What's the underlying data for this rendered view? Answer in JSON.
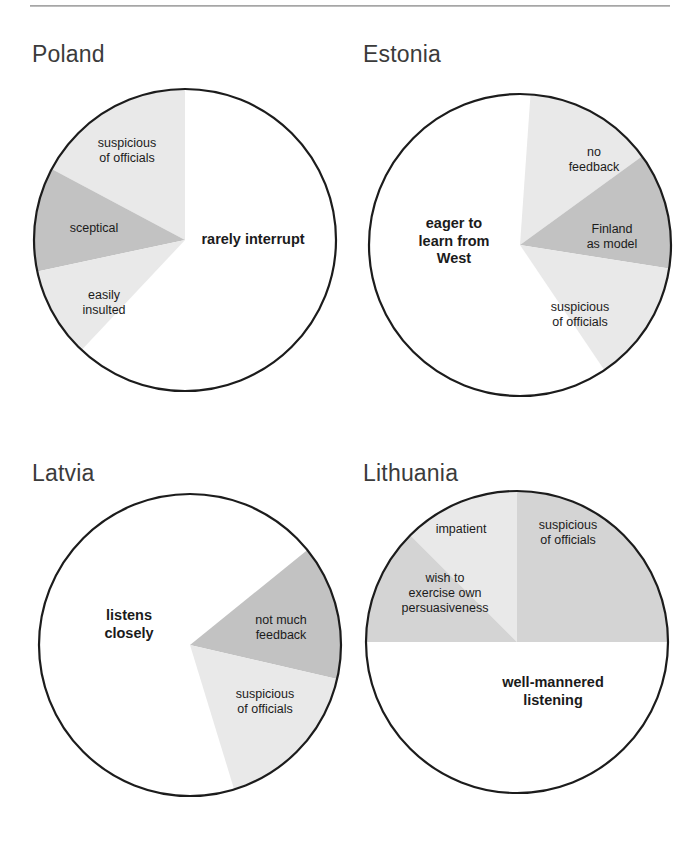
{
  "page": {
    "background_color": "#ffffff",
    "divider_color": "#9a9a9a"
  },
  "palette": {
    "white": "#ffffff",
    "light_gray": "#e9e9e9",
    "medium_gray": "#d4d4d4",
    "dark_gray": "#c2c2c2",
    "outline": "#1c1c1c",
    "title_text": "#3b3b3b",
    "label_text": "#1b1b1b"
  },
  "chart_data": [
    {
      "type": "pie",
      "title": "Poland",
      "center": [
        185,
        240
      ],
      "radius": 151,
      "slices": [
        {
          "label": "rarely interrupt",
          "percent": 62,
          "fill": "#ffffff",
          "emphasis": "major",
          "label_pos": [
            253,
            240
          ]
        },
        {
          "label": "suspicious\nof officials",
          "percent": 13,
          "fill": "#e9e9e9",
          "emphasis": "minor",
          "label_pos": [
            127,
            151
          ]
        },
        {
          "label": "sceptical",
          "percent": 13,
          "fill": "#c2c2c2",
          "emphasis": "minor",
          "label_pos": [
            94,
            228
          ]
        },
        {
          "label": "easily\ninsulted",
          "percent": 12,
          "fill": "#e9e9e9",
          "emphasis": "minor",
          "label_pos": [
            104,
            303
          ]
        }
      ]
    },
    {
      "type": "pie",
      "title": "Estonia",
      "center": [
        520,
        245
      ],
      "radius": 151,
      "slices": [
        {
          "label": "eager to\nlearn from\nWest",
          "percent": 58,
          "fill": "#ffffff",
          "emphasis": "major",
          "label_pos": [
            454,
            241
          ]
        },
        {
          "label": "no\nfeedback",
          "percent": 14,
          "fill": "#e9e9e9",
          "emphasis": "minor",
          "label_pos": [
            594,
            160
          ]
        },
        {
          "label": "Finland\nas model",
          "percent": 13,
          "fill": "#c2c2c2",
          "emphasis": "minor",
          "label_pos": [
            612,
            237
          ]
        },
        {
          "label": "suspicious\nof officials",
          "percent": 15,
          "fill": "#e9e9e9",
          "emphasis": "minor",
          "label_pos": [
            580,
            315
          ]
        }
      ]
    },
    {
      "type": "pie",
      "title": "Latvia",
      "center": [
        190,
        645
      ],
      "radius": 151,
      "slices": [
        {
          "label": "listens\ncloselly",
          "percent": 78,
          "fill": "#ffffff",
          "emphasis": "major",
          "label_pos": [
            129,
            624
          ]
        },
        {
          "label": "not much\nfeedback",
          "percent": 11,
          "fill": "#c2c2c2",
          "emphasis": "minor",
          "label_pos": [
            281,
            628
          ]
        },
        {
          "label": "suspicious\nof officials",
          "percent": 11,
          "fill": "#e9e9e9",
          "emphasis": "minor",
          "label_pos": [
            265,
            702
          ]
        }
      ]
    },
    {
      "type": "pie",
      "title": "Lithuania",
      "center": [
        517,
        642
      ],
      "radius": 151,
      "slices": [
        {
          "label": "well-mannered\nlistening",
          "percent": 58,
          "fill": "#ffffff",
          "emphasis": "major",
          "label_pos": [
            553,
            691
          ]
        },
        {
          "label": "suspicious\nof  officials",
          "percent": 17,
          "fill": "#d4d4d4",
          "emphasis": "minor",
          "label_pos": [
            568,
            533
          ]
        },
        {
          "label": "impatient",
          "percent": 12,
          "fill": "#e9e9e9",
          "emphasis": "minor",
          "label_pos": [
            461,
            529
          ]
        },
        {
          "label": "wish to\nexercise own\npersuasiveness",
          "percent": 13,
          "fill": "#d4d4d4",
          "emphasis": "minor",
          "label_pos": [
            445,
            593
          ]
        }
      ]
    }
  ],
  "panels": [
    {
      "key": "poland",
      "title": "Poland",
      "title_pos": [
        32,
        41
      ],
      "slices": [
        {
          "name": "rarely-interrupt",
          "label": "rarely interrupt",
          "start": -90,
          "end": 133.2,
          "fill": "#ffffff",
          "emphasis": "major",
          "lx": 253,
          "ly": 240
        },
        {
          "name": "suspicious-of-officials",
          "label": "suspicious\nof officials",
          "start": -152.0,
          "end": -90,
          "fill": "#e9e9e9",
          "emphasis": "minor",
          "lx": 127,
          "ly": 151
        },
        {
          "name": "sceptical",
          "label": "sceptical",
          "start": 168.0,
          "end": 208.0,
          "fill": "#c2c2c2",
          "emphasis": "minor",
          "lx": 94,
          "ly": 228
        },
        {
          "name": "easily-insulted",
          "label": "easily\ninsulted",
          "start": 133.2,
          "end": 168.0,
          "fill": "#e9e9e9",
          "emphasis": "minor",
          "lx": 104,
          "ly": 303
        }
      ]
    },
    {
      "key": "estonia",
      "title": "Estonia",
      "title_pos": [
        363,
        41
      ],
      "slices": [
        {
          "name": "eager-to-learn-from-west",
          "label": "eager to\nlearn from\nWest",
          "start": 56.0,
          "end": 266.0,
          "fill": "#ffffff",
          "emphasis": "major",
          "lx": 454,
          "ly": 241
        },
        {
          "name": "no-feedback",
          "label": "no\nfeedback",
          "start": -86.0,
          "end": -36.0,
          "fill": "#e9e9e9",
          "emphasis": "minor",
          "lx": 594,
          "ly": 160
        },
        {
          "name": "finland-as-model",
          "label": "Finland\nas model",
          "start": -36.0,
          "end": 9.0,
          "fill": "#c2c2c2",
          "emphasis": "minor",
          "lx": 612,
          "ly": 237
        },
        {
          "name": "suspicious-of-officials",
          "label": "suspicious\nof officials",
          "start": 9.0,
          "end": 56.0,
          "fill": "#e9e9e9",
          "emphasis": "minor",
          "lx": 580,
          "ly": 315
        }
      ]
    },
    {
      "key": "latvia",
      "title": "Latvia",
      "title_pos": [
        32,
        460
      ],
      "slices": [
        {
          "name": "listens-closely",
          "label": "listens\nclosely",
          "start": 73.0,
          "end": 321.0,
          "fill": "#ffffff",
          "emphasis": "major",
          "lx": 129,
          "ly": 624
        },
        {
          "name": "not-much-feedback",
          "label": "not much\nfeedback",
          "start": -39.0,
          "end": 13.0,
          "fill": "#c2c2c2",
          "emphasis": "minor",
          "lx": 281,
          "ly": 628
        },
        {
          "name": "suspicious-of-officials",
          "label": "suspicious\nof officials",
          "start": 13.0,
          "end": 73.0,
          "fill": "#e9e9e9",
          "emphasis": "minor",
          "lx": 265,
          "ly": 702
        }
      ]
    },
    {
      "key": "lithuania",
      "title": "Lithuania",
      "title_pos": [
        363,
        460
      ],
      "slices": [
        {
          "name": "well-mannered-listening",
          "label": "well-mannered\nlistening",
          "start": 0.0,
          "end": 180.0,
          "fill": "#ffffff",
          "emphasis": "major",
          "lx": 553,
          "ly": 691
        },
        {
          "name": "suspicious-of-officials",
          "label": "suspicious\nof  officials",
          "start": -90.0,
          "end": 0.0,
          "fill": "#d4d4d4",
          "emphasis": "minor",
          "lx": 568,
          "ly": 533
        },
        {
          "name": "impatient",
          "label": "impatient",
          "start": -135.0,
          "end": -90.0,
          "fill": "#e9e9e9",
          "emphasis": "minor",
          "lx": 461,
          "ly": 529
        },
        {
          "name": "wish-to-exercise-own-persuasiveness",
          "label": "wish to\nexercise own\npersuasiveness",
          "start": 180.0,
          "end": 225.0,
          "fill": "#d4d4d4",
          "emphasis": "minor",
          "lx": 445,
          "ly": 593
        }
      ]
    }
  ],
  "geometry": {
    "poland": {
      "cx": 185,
      "cy": 240,
      "r": 151
    },
    "estonia": {
      "cx": 520,
      "cy": 245,
      "r": 151
    },
    "latvia": {
      "cx": 190,
      "cy": 645,
      "r": 151
    },
    "lithuania": {
      "cx": 517,
      "cy": 642,
      "r": 151
    }
  }
}
